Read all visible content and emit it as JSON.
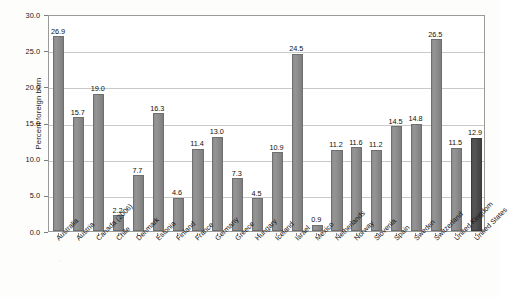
{
  "chart_data": {
    "type": "bar",
    "title": "",
    "subtitle": "",
    "xlabel": "",
    "ylabel": "Percent foreign born",
    "ylim": [
      0.0,
      30.0
    ],
    "ytick_step": 5.0,
    "ytick_labels": [
      "0.0",
      "5.0",
      "10.0",
      "15.0",
      "20.0",
      "25.0",
      "30.0"
    ],
    "ytick_values": [
      0.0,
      5.0,
      10.0,
      15.0,
      20.0,
      25.0,
      30.0
    ],
    "grid": "horizontal",
    "legend": "none",
    "legend_position": "none",
    "bar_color": "#8a8a8a",
    "highlight_color": "#4a4a4a",
    "highlight_category": "United States",
    "categories": [
      "Australia",
      "Austria",
      "Canada (2006)",
      "Chile",
      "Denmark",
      "Estonia",
      "Finland",
      "France",
      "Germany",
      "Greece",
      "Hungary",
      "Iceland",
      "Israel",
      "Mexico",
      "Netherlands",
      "Norway",
      "Slovenia",
      "Spain",
      "Sweden",
      "Switzerland",
      "United Kingdom",
      "United States"
    ],
    "values": [
      26.9,
      15.7,
      19.0,
      2.2,
      7.7,
      16.3,
      4.6,
      11.4,
      13.0,
      7.3,
      4.5,
      10.9,
      24.5,
      0.9,
      11.2,
      11.6,
      11.2,
      14.5,
      14.8,
      26.5,
      11.5,
      12.9
    ],
    "value_labels": [
      "26.9",
      "15.7",
      "19.0",
      "2.2",
      "7.7",
      "16.3",
      "4.6",
      "11.4",
      "13.0",
      "7.3",
      "4.5",
      "10.9",
      "24.5",
      "0.9",
      "11.2",
      "11.6",
      "11.2",
      "14.5",
      "14.8",
      "26.5",
      "11.5",
      "12.9"
    ]
  }
}
